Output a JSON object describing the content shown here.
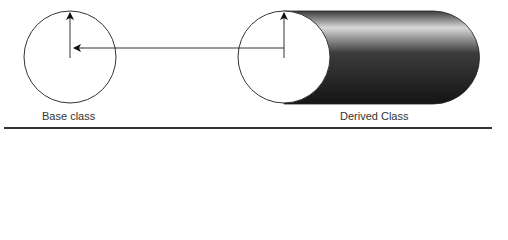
{
  "diagram": {
    "base": {
      "label": "Base class"
    },
    "derived": {
      "label": "Derived Class"
    },
    "colors": {
      "stroke": "#333333",
      "cylinder_dark": "#1e1e1e",
      "cylinder_light": "#d8d8d8"
    }
  }
}
